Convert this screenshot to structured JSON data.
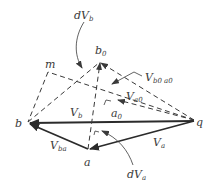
{
  "diagram": {
    "type": "velocity-vector-diagram",
    "colors": {
      "ink": "#2b2b2b",
      "label": "#3a3a3a",
      "background": "#ffffff"
    },
    "points": {
      "q": {
        "label": "q"
      },
      "b": {
        "label": "b"
      },
      "a": {
        "label": "a"
      },
      "b0": {
        "label": "b",
        "sub": "0"
      },
      "a0": {
        "label": "a",
        "sub": "0"
      },
      "m": {
        "label": "m"
      }
    },
    "vectors": {
      "Vb": {
        "label": "V",
        "sub": "b"
      },
      "Va": {
        "label": "V",
        "sub": "a"
      },
      "Vba": {
        "label": "V",
        "sub": "ba"
      },
      "Va0": {
        "label": "V",
        "sub": "a0"
      },
      "Vb0a0": {
        "label": "V",
        "sub": "b0 a0"
      },
      "dVb": {
        "label": "dV",
        "sub": "b"
      },
      "dVa": {
        "label": "dV",
        "sub": "a"
      }
    }
  }
}
